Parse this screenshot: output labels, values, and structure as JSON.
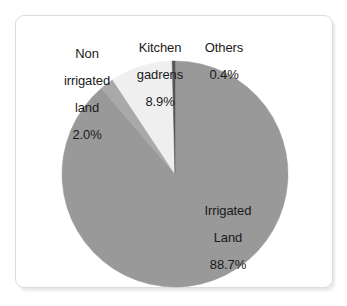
{
  "chart_data": {
    "type": "pie",
    "title": "",
    "subtitle": "",
    "xlabel": "",
    "ylabel": "",
    "legend_position": "none",
    "grid": false,
    "units": "percent",
    "start_angle_deg": 0,
    "direction": "clockwise",
    "categories": [
      "Irrigated Land",
      "Non irrigated land",
      "Kitchen gadrens",
      "Others"
    ],
    "values": [
      88.7,
      2.0,
      8.9,
      0.4
    ],
    "slices": [
      {
        "name": "Irrigated Land",
        "label_line1": "Irrigated",
        "label_line2": "Land",
        "value": 88.7,
        "value_label": "88.7%",
        "color": "#999999",
        "label_placement": "inside"
      },
      {
        "name": "Non irrigated land",
        "label_line1": "Non",
        "label_line2": "irrigated",
        "label_line3": "land",
        "value": 2.0,
        "value_label": "2.0%",
        "color": "#a9a9a9",
        "label_placement": "outside"
      },
      {
        "name": "Kitchen gadrens",
        "label_line1": "Kitchen",
        "label_line2": "gadrens",
        "value": 8.9,
        "value_label": "8.9%",
        "color": "#efefef",
        "label_placement": "outside"
      },
      {
        "name": "Others",
        "label_line1": "Others",
        "value": 0.4,
        "value_label": "0.4%",
        "color": "#555555",
        "label_placement": "outside"
      }
    ]
  },
  "figure": {
    "background_color": "#ffffff",
    "card_border_color": "#dcdcdc",
    "label_text_color": "#1a1a1a"
  }
}
